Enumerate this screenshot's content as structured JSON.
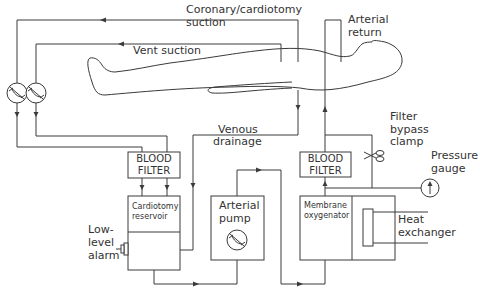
{
  "diagram": {
    "type": "cardiopulmonary bypass circuit",
    "labels": {
      "coronary_suction_line1": "Coronary/cardiotomy",
      "coronary_suction_line2": "suction",
      "vent_suction": "Vent suction",
      "arterial_return_line1": "Arterial",
      "arterial_return_line2": "return",
      "venous_drainage_line1": "Venous",
      "venous_drainage_line2": "drainage",
      "filter_bypass_line1": "Filter",
      "filter_bypass_line2": "bypass",
      "filter_bypass_line3": "clamp",
      "pressure_gauge_line1": "Pressure",
      "pressure_gauge_line2": "gauge",
      "low_level_alarm_line1": "Low-",
      "low_level_alarm_line2": "level",
      "low_level_alarm_line3": "alarm",
      "heat_exchanger_line1": "Heat",
      "heat_exchanger_line2": "exchanger"
    },
    "components": {
      "blood_filter_left_line1": "BLOOD",
      "blood_filter_left_line2": "FILTER",
      "cardiotomy_reservoir_line1": "Cardiotomy",
      "cardiotomy_reservoir_line2": "reservoir",
      "arterial_pump_line1": "Arterial",
      "arterial_pump_line2": "pump",
      "blood_filter_right_line1": "BLOOD",
      "blood_filter_right_line2": "FILTER",
      "membrane_oxygenator_line1": "Membrane",
      "membrane_oxygenator_line2": "oxygenator"
    },
    "icons": [
      "roller-pump-icon",
      "roller-pump-icon",
      "roller-pump-icon",
      "scissor-clamp-icon",
      "pressure-gauge-icon",
      "alarm-icon",
      "patient-outline"
    ],
    "colors": {
      "line": "#3a3a3a",
      "text": "#333333",
      "background": "#ffffff"
    }
  }
}
